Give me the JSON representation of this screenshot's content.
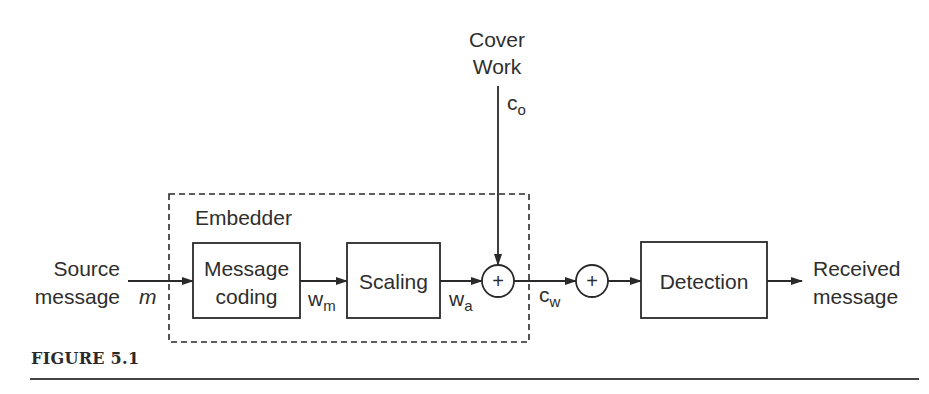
{
  "figure": {
    "caption": "FIGURE 5.1"
  },
  "inputs": {
    "source_line1": "Source",
    "source_line2": "message",
    "source_symbol": "m",
    "cover_line1": "Cover",
    "cover_line2": "Work",
    "cover_symbol": "c",
    "cover_subscript": "o"
  },
  "embedder": {
    "label": "Embedder",
    "message_coding_line1": "Message",
    "message_coding_line2": "coding",
    "wm_symbol": "w",
    "wm_subscript": "m",
    "scaling_label": "Scaling",
    "wa_symbol": "w",
    "wa_subscript": "a",
    "adder_symbol": "+"
  },
  "channel": {
    "cw_symbol": "c",
    "cw_subscript": "w",
    "noise_adder_symbol": "+"
  },
  "detector": {
    "label": "Detection",
    "output_line1": "Received",
    "output_line2": "message"
  },
  "colors": {
    "stroke": "#2a2a2a",
    "background": "#ffffff"
  }
}
